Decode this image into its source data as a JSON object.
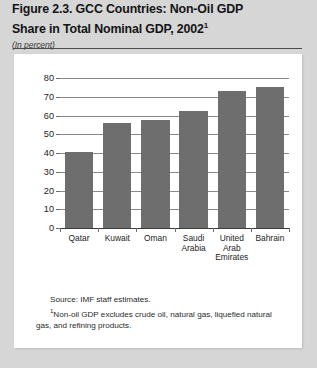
{
  "figure": {
    "title_line1": "Figure 2.3. GCC Countries: Non-Oil GDP",
    "title_line2": "Share in Total Nominal GDP, 2002",
    "title_superscript": "1",
    "subtitle": "(In percent)",
    "source_note": "Source: IMF staff estimates.",
    "footnote_marker": "1",
    "footnote_text": "Non-oil GDP excludes crude oil, natural gas, liquefied natural gas, and refining products."
  },
  "colors": {
    "page_background": "#d6d6d6",
    "panel_background": "#ffffff",
    "bar_fill": "#6e6e6e",
    "gridline": "#8a8a8a",
    "axis": "#3d3d3d",
    "text": "#1c1c1c"
  },
  "chart_data": {
    "type": "bar",
    "title": "Figure 2.3. GCC Countries: Non-Oil GDP Share in Total Nominal GDP, 2002",
    "subtitle": "(In percent)",
    "xlabel": "",
    "ylabel": "",
    "categories": [
      "Qatar",
      "Kuwait",
      "Oman",
      "Saudi\nArabia",
      "United\nArab\nEmirates",
      "Bahrain"
    ],
    "values": [
      40.5,
      56,
      57.5,
      62.5,
      73,
      75
    ],
    "ylim": [
      0,
      80
    ],
    "yticks": [
      0,
      10,
      20,
      30,
      40,
      50,
      60,
      70,
      80
    ],
    "ytick_labels": [
      "0",
      "10",
      "20",
      "30",
      "40",
      "50",
      "60",
      "70",
      "80"
    ],
    "grid": true,
    "legend": "none"
  }
}
